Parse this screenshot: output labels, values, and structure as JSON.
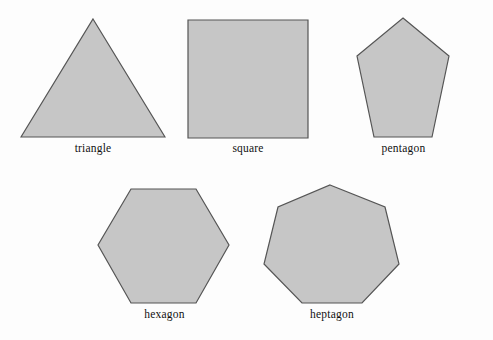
{
  "figure": {
    "title": "",
    "background_color": "#fdfdfd",
    "shape_fill_color": "#c6c6c6",
    "shape_stroke_color": "#555555",
    "label_color": "#111111"
  },
  "shapes": [
    {
      "name": "triangle",
      "label": "triangle",
      "sides": 3,
      "points": "73,7 145,125 1,125"
    },
    {
      "name": "square",
      "label": "square",
      "sides": 4,
      "points": "5,8 125,8 125,126 5,126"
    },
    {
      "name": "pentagon",
      "label": "pentagon",
      "sides": 5,
      "points": "47,6 93,44 76,125 18,125 1,44"
    },
    {
      "name": "hexagon",
      "label": "hexagon",
      "sides": 6,
      "points": "36,8 101,8 134,64 101,122 36,122 3,64"
    },
    {
      "name": "heptagon",
      "label": "heptagon",
      "sides": 7,
      "points": "72,6 127,28 141,85 104,124 44,124 6,85 20,28"
    }
  ]
}
